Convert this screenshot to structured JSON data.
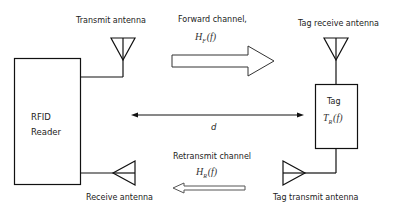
{
  "diagram": {
    "reader": {
      "line1": "RFID",
      "line2": "Reader"
    },
    "tag": {
      "label": "Tag",
      "function": {
        "base": "T",
        "sub": "R",
        "arg": "(f)"
      }
    },
    "transmit_antenna": "Transmit antenna",
    "receive_antenna": "Receive antenna",
    "tag_receive_antenna": "Tag receive antenna",
    "tag_transmit_antenna": "Tag transmit antenna",
    "forward_channel": {
      "label": "Forward channel,",
      "base": "H",
      "sub": "F",
      "arg": "(f)"
    },
    "retransmit_channel": {
      "label": "Retransmit channel",
      "base": "H",
      "sub": "R",
      "arg": "(f)"
    },
    "distance": "d"
  }
}
